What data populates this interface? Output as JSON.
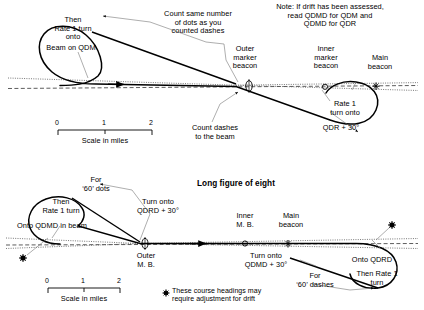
{
  "figure": {
    "title": "Long figure of eight",
    "note": "Note: If drift has been assessed,\nread QDMD for QDM and\nQDMD for QDR",
    "drift_footnote": "These course headings may\nrequire adjustment for drift",
    "ink_color": "#000000",
    "beam_color": "#444444"
  },
  "top_panel": {
    "loop_label": "Then\nRate 1 turn\nonto",
    "beam_label": "Beam on QDM",
    "count_dots": "Count same number\nof dots as you\ncounted dashes",
    "outer_marker": "Outer\nmarker\nbeacon",
    "inner_marker": "Inner\nmarker\nbeacon",
    "main_beacon": "Main\nbeacon",
    "right_turn": "Rate 1\nturn onto",
    "qdr_label": "QDR + 30°",
    "count_dashes": "Count dashes\nto the beam",
    "scale": {
      "ticks": [
        "0",
        "1",
        "2"
      ],
      "caption": "Scale in miles"
    }
  },
  "bottom_panel": {
    "for_dots": "For\n‘60’ dots",
    "loop_label": "Then\nRate 1 turn",
    "onto_beam": "Onto QDMD in beam",
    "turn_qdrd": "Turn onto\nQDRD + 30°",
    "outer_mb": "Outer\nM. B.",
    "inner_mb": "Inner\nM. B.",
    "main_beacon": "Main\nbeacon",
    "turn_qdmd": "Turn onto\nQDMD + 30°",
    "for_dashes": "For\n‘60’ dashes",
    "onto_qdrd": "Onto QDRD",
    "then_rate1": "Then Rate 1\nturn",
    "scale": {
      "ticks": [
        "0",
        "1",
        "2"
      ],
      "caption": "Scale in miles"
    }
  }
}
